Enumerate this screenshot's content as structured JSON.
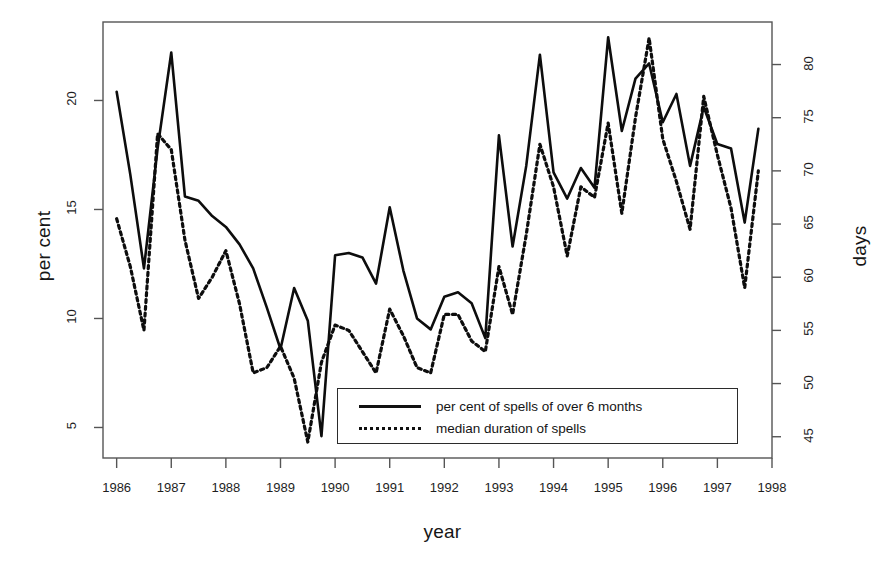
{
  "chart_data": {
    "type": "line",
    "title": "",
    "xlabel": "year",
    "ylabel": "per cent",
    "ylabel_right": "days",
    "xlim": [
      1985.75,
      1998.0
    ],
    "ylim": [
      3.6,
      23.6
    ],
    "ylim_right": [
      43.0,
      84.0
    ],
    "grid": false,
    "legend_position": "bottom-center",
    "xticks": [
      "1986",
      "1987",
      "1988",
      "1989",
      "1990",
      "1991",
      "1992",
      "1993",
      "1994",
      "1995",
      "1996",
      "1997",
      "1998"
    ],
    "xtick_values": [
      1986,
      1987,
      1988,
      1989,
      1990,
      1991,
      1992,
      1993,
      1994,
      1995,
      1996,
      1997,
      1998
    ],
    "yticks_left": [
      "5",
      "10",
      "15",
      "20"
    ],
    "ytick_values_left": [
      5,
      10,
      15,
      20
    ],
    "yticks_right": [
      "45",
      "50",
      "55",
      "60",
      "65",
      "70",
      "75",
      "80"
    ],
    "ytick_values_right": [
      45,
      50,
      55,
      60,
      65,
      70,
      75,
      80
    ],
    "x": [
      1986.0,
      1986.25,
      1986.5,
      1986.75,
      1987.0,
      1987.25,
      1987.5,
      1987.75,
      1988.0,
      1988.25,
      1988.5,
      1988.75,
      1989.0,
      1989.25,
      1989.5,
      1989.75,
      1990.0,
      1990.25,
      1990.5,
      1990.75,
      1991.0,
      1991.25,
      1991.5,
      1991.75,
      1992.0,
      1992.25,
      1992.5,
      1992.75,
      1993.0,
      1993.25,
      1993.5,
      1993.75,
      1994.0,
      1994.25,
      1994.5,
      1994.75,
      1995.0,
      1995.25,
      1995.5,
      1995.75,
      1996.0,
      1996.25,
      1996.5,
      1996.75,
      1997.0,
      1997.25,
      1997.5,
      1997.75
    ],
    "series": [
      {
        "name": "per cent of spells of over 6 months",
        "axis": "left",
        "style": "solid",
        "units": "per cent",
        "values": [
          20.4,
          16.6,
          12.3,
          17.8,
          22.2,
          15.6,
          15.4,
          14.7,
          14.2,
          13.4,
          12.3,
          10.5,
          8.6,
          11.4,
          9.9,
          4.6,
          12.9,
          13.0,
          12.8,
          11.6,
          15.1,
          12.2,
          10.0,
          9.5,
          11.0,
          11.2,
          10.7,
          9.1,
          18.4,
          13.3,
          17.0,
          22.1,
          16.7,
          15.5,
          16.9,
          16.0,
          22.9,
          18.6,
          21.0,
          21.7,
          19.0,
          20.3,
          17.0,
          19.7,
          18.0,
          17.8,
          14.4,
          18.7
        ]
      },
      {
        "name": "median duration of spells",
        "axis": "right",
        "style": "dotted",
        "units": "days",
        "values": [
          65.5,
          61.0,
          55.0,
          73.5,
          72.0,
          63.5,
          58.0,
          60.0,
          62.5,
          57.5,
          51.0,
          51.5,
          53.5,
          50.5,
          44.5,
          52.0,
          55.5,
          55.0,
          53.0,
          51.0,
          57.0,
          54.5,
          51.5,
          51.0,
          56.5,
          56.5,
          54.0,
          53.0,
          61.0,
          56.5,
          64.0,
          72.5,
          68.5,
          62.0,
          68.5,
          67.5,
          74.5,
          66.0,
          75.0,
          82.5,
          73.0,
          69.0,
          64.5,
          77.0,
          71.5,
          66.5,
          59.0,
          70.0
        ]
      }
    ]
  },
  "legend": {
    "items": [
      {
        "label": "per cent of spells of over 6 months",
        "style": "solid"
      },
      {
        "label": "median duration of spells",
        "style": "dotted"
      }
    ]
  },
  "labels": {
    "x_axis_title": "year",
    "y_axis_left_title": "per cent",
    "y_axis_right_title": "days"
  }
}
